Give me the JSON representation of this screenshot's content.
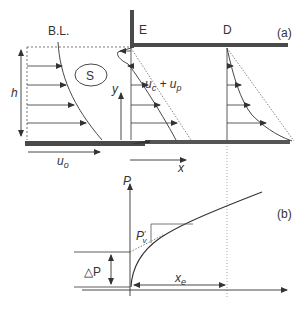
{
  "panel_a": {
    "tag": "(a)",
    "labels": {
      "boundary_layer": "B.L.",
      "station_e": "E",
      "station_d": "D",
      "region_s": "S",
      "height": "h",
      "y_axis": "y",
      "x_axis": "x",
      "inlet_velocity": "u",
      "inlet_velocity_sub": "o",
      "combined_velocity_u": "u",
      "combined_velocity_c": "c",
      "combined_velocity_plus": " + u",
      "combined_velocity_p": "p"
    }
  },
  "panel_b": {
    "tag": "(b)",
    "labels": {
      "pressure_axis": "P",
      "pressure_prime": "P",
      "pressure_prime_sub": "v",
      "pressure_prime_sup": "′",
      "delta_p": "△P",
      "entrance_length": "x",
      "entrance_length_sub": "e"
    }
  },
  "colors": {
    "line": "#333333",
    "wall": "#4a4a4a",
    "dashed": "#555555"
  }
}
